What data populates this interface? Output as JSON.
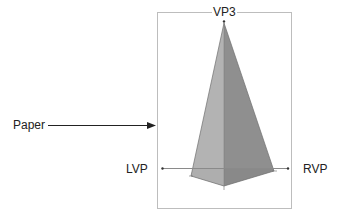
{
  "diagram": {
    "labels": {
      "vp3": "VP3",
      "lvp": "LVP",
      "rvp": "RVP",
      "paper": "Paper"
    },
    "colors": {
      "paper_border": "#bdbdbd",
      "horizon_line": "#8a8a8a",
      "left_face": "#b3b3b3",
      "right_face": "#8f8f8f",
      "base_face": "#a6a6a6",
      "edge": "#6e6e6e",
      "arrow": "#222222",
      "text": "#222222"
    },
    "geometry": {
      "paper_rect": {
        "x": 157,
        "y": 12,
        "width": 134,
        "height": 196
      },
      "apex": {
        "x": 224,
        "y": 23
      },
      "base_left": {
        "x": 191,
        "y": 176
      },
      "base_front": {
        "x": 224,
        "y": 186
      },
      "base_right": {
        "x": 274,
        "y": 171
      },
      "horizon_y": 168,
      "lvp_point": {
        "x": 162,
        "y": 168
      },
      "rvp_point": {
        "x": 288,
        "y": 168
      },
      "arrow": {
        "x1": 48,
        "y1": 125,
        "x2": 156,
        "y2": 125
      }
    }
  }
}
